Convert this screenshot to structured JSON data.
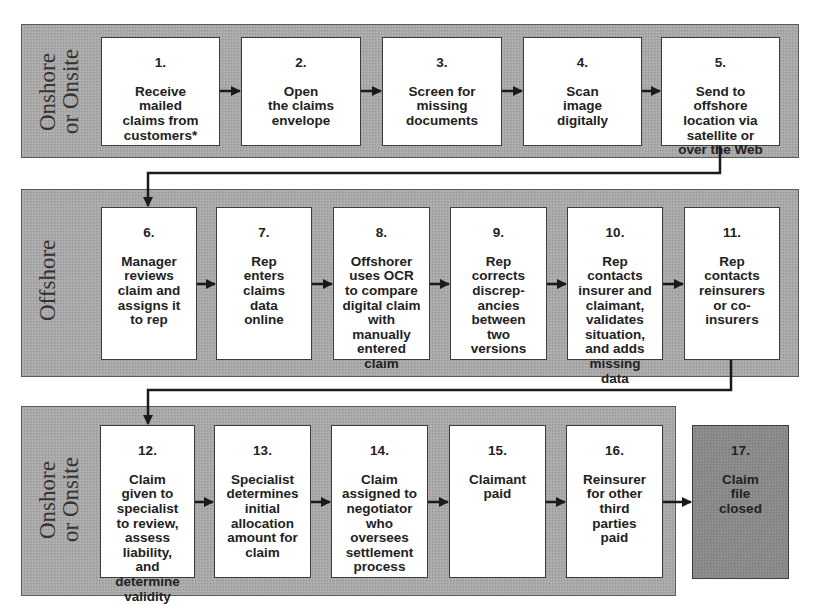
{
  "diagram": {
    "type": "swimlane-flowchart",
    "lanes": [
      {
        "id": "lane1",
        "label": "Onshore\nor Onsite",
        "steps": [
          "1",
          "2",
          "3",
          "4",
          "5"
        ]
      },
      {
        "id": "lane2",
        "label": "Offshore",
        "steps": [
          "6",
          "7",
          "8",
          "9",
          "10",
          "11"
        ]
      },
      {
        "id": "lane3",
        "label": "Onshore\nor Onsite",
        "steps": [
          "12",
          "13",
          "14",
          "15",
          "16"
        ]
      }
    ],
    "steps": [
      {
        "num": "1.",
        "text": "Receive\nmailed\nclaims from\ncustomers*"
      },
      {
        "num": "2.",
        "text": "Open\nthe claims\nenvelope"
      },
      {
        "num": "3.",
        "text": "Screen for\nmissing\ndocuments"
      },
      {
        "num": "4.",
        "text": "Scan\nimage\ndigitally"
      },
      {
        "num": "5.",
        "text": "Send to\noffshore\nlocation via\nsatellite or\nover the Web"
      },
      {
        "num": "6.",
        "text": "Manager\nreviews\nclaim and\nassigns it\nto rep"
      },
      {
        "num": "7.",
        "text": "Rep\nenters\nclaims\ndata\nonline"
      },
      {
        "num": "8.",
        "text": "Offshorer\nuses OCR\nto compare\ndigital claim\nwith\nmanually\nentered\nclaim"
      },
      {
        "num": "9.",
        "text": "Rep\ncorrects\ndiscrep-\nancies\nbetween\ntwo\nversions"
      },
      {
        "num": "10.",
        "text": "Rep\ncontacts\ninsurer and\nclaimant,\nvalidates\nsituation,\nand adds\nmissing\ndata"
      },
      {
        "num": "11.",
        "text": "Rep\ncontacts\nreinsurers\nor co-\ninsurers"
      },
      {
        "num": "12.",
        "text": "Claim\ngiven to\nspecialist\nto review,\nassess\nliability,\nand\ndetermine\nvalidity"
      },
      {
        "num": "13.",
        "text": "Specialist\ndetermines\ninitial\nallocation\namount for\nclaim"
      },
      {
        "num": "14.",
        "text": "Claim\nassigned to\nnegotiator\nwho\noversees\nsettlement\nprocess"
      },
      {
        "num": "15.",
        "text": "Claimant\npaid"
      },
      {
        "num": "16.",
        "text": "Reinsurer\nfor other\nthird\nparties\npaid"
      },
      {
        "num": "17.",
        "text": "Claim\nfile\nclosed"
      }
    ],
    "colors": {
      "lane_fill": "#a9a9a9",
      "step_fill": "#ffffff",
      "final_step_fill": "#8a8a8a",
      "arrow": "#1a1a1a"
    }
  }
}
